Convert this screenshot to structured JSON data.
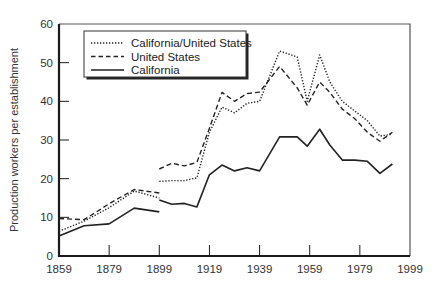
{
  "chart_data": {
    "type": "line",
    "title": "",
    "xlabel": "",
    "ylabel": "Production workers per establishment",
    "xlim": [
      1859,
      1999
    ],
    "ylim": [
      0,
      60
    ],
    "x_ticks": [
      1859,
      1879,
      1899,
      1919,
      1939,
      1959,
      1979,
      1999
    ],
    "y_ticks": [
      0,
      10,
      20,
      30,
      40,
      50,
      60
    ],
    "grid": false,
    "legend_position": "upper left (boxed, inside plot)",
    "legend": [
      "California/United States",
      "United States",
      "California"
    ],
    "series": [
      {
        "name": "California/United States",
        "style": "dotted",
        "segments": [
          {
            "x": [
              1859,
              1869,
              1879,
              1889,
              1899
            ],
            "y": [
              6.4,
              9.0,
              12.5,
              16.8,
              15.0
            ]
          },
          {
            "x": [
              1899,
              1904,
              1909,
              1914,
              1919,
              1924,
              1929,
              1934,
              1939,
              1947,
              1954,
              1958,
              1963,
              1967,
              1972,
              1977,
              1982,
              1987,
              1992
            ],
            "y": [
              19.3,
              19.5,
              19.5,
              20.2,
              32.0,
              38.5,
              37.0,
              39.5,
              40.0,
              53.0,
              51.5,
              40.0,
              52.0,
              45.0,
              40.0,
              37.5,
              35.0,
              31.0,
              31.5
            ]
          }
        ]
      },
      {
        "name": "United States",
        "style": "dashed",
        "segments": [
          {
            "x": [
              1859,
              1869,
              1879,
              1889,
              1899
            ],
            "y": [
              9.7,
              9.4,
              13.5,
              17.2,
              16.3
            ]
          },
          {
            "x": [
              1899,
              1904,
              1909,
              1914,
              1919,
              1924,
              1929,
              1934,
              1939,
              1947,
              1954,
              1958,
              1963,
              1967,
              1972,
              1977,
              1982,
              1987,
              1992
            ],
            "y": [
              22.5,
              24.0,
              23.3,
              24.2,
              33.0,
              42.3,
              40.0,
              42.0,
              42.4,
              49.0,
              43.5,
              39.0,
              45.0,
              42.3,
              38.0,
              35.5,
              32.0,
              29.7,
              32.0
            ]
          }
        ]
      },
      {
        "name": "California",
        "style": "solid",
        "segments": [
          {
            "x": [
              1859,
              1869,
              1879,
              1889,
              1899
            ],
            "y": [
              5.2,
              7.8,
              8.3,
              12.4,
              11.4
            ]
          },
          {
            "x": [
              1899,
              1904,
              1909,
              1914,
              1919,
              1924,
              1929,
              1934,
              1939,
              1947,
              1954,
              1958,
              1963,
              1967,
              1972,
              1977,
              1982,
              1987,
              1992
            ],
            "y": [
              14.5,
              13.4,
              13.6,
              12.7,
              21.0,
              23.5,
              22.0,
              22.8,
              22.0,
              30.8,
              30.8,
              28.4,
              32.8,
              28.7,
              24.8,
              24.8,
              24.5,
              21.4,
              23.8
            ]
          }
        ]
      }
    ]
  },
  "colors": {
    "line": "#222222",
    "axis": "#1a1a1a",
    "frame": "#555555",
    "background": "#ffffff"
  }
}
